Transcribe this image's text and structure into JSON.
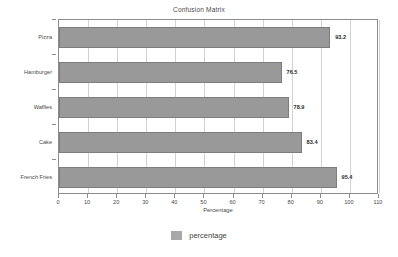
{
  "chart_data": {
    "type": "bar",
    "orientation": "horizontal",
    "title": "Confusion Matrix",
    "xlabel": "Percentage",
    "ylabel": "",
    "categories": [
      "Pizza",
      "Hamburger",
      "Waffles",
      "Cake",
      "French Fries"
    ],
    "values": [
      93.2,
      76.5,
      78.9,
      83.4,
      95.4
    ],
    "value_labels": [
      "93.2",
      "76.5",
      "78.9",
      "83.4",
      "95.4"
    ],
    "series": [
      {
        "name": "percentage",
        "values": [
          93.2,
          76.5,
          78.9,
          83.4,
          95.4
        ],
        "color": "#999999"
      }
    ],
    "xlim": [
      0,
      110
    ],
    "xticks": [
      0,
      10,
      20,
      30,
      40,
      50,
      60,
      70,
      80,
      90,
      100,
      110
    ],
    "xtick_labels": [
      "0",
      "10",
      "20",
      "30",
      "40",
      "50",
      "60",
      "70",
      "80",
      "90",
      "100",
      "110"
    ],
    "grid": "vertical",
    "legend": {
      "position": "bottom",
      "entries": [
        {
          "label": "percentage",
          "color": "#a8a8a8"
        }
      ]
    },
    "colors": {
      "bar_fill": "#999999",
      "bar_edge": "#7d7d7d",
      "gridline": "#d2d2d2",
      "frame": "#8c8c8c",
      "text": "#4a4a4a",
      "background": "#ffffff"
    }
  }
}
